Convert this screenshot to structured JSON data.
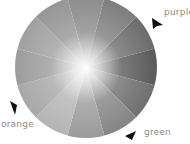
{
  "diagram": {
    "type": "color-wheel",
    "segments": 12,
    "center": [
      86,
      67
    ],
    "radius": 71,
    "segment_shades": [
      "#8c8c8c",
      "#7e7e7e",
      "#6c6c6c",
      "#5a5a5a",
      "#6e6e6e",
      "#848484",
      "#9a9a9a",
      "#b4b4b4",
      "#a8a8a8",
      "#9c9c9c",
      "#a0a0a0",
      "#969696"
    ],
    "labels": [
      {
        "text": "purple",
        "x": 164,
        "y": 9
      },
      {
        "text": "orange",
        "x": 1,
        "y": 121
      },
      {
        "text": "green",
        "x": 144,
        "y": 129
      }
    ]
  }
}
